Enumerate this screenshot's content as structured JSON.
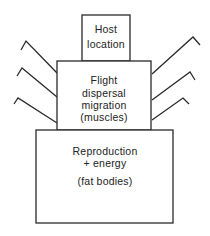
{
  "diagram": {
    "boxes": [
      {
        "id": "host",
        "lines": [
          "Host",
          "location"
        ]
      },
      {
        "id": "flight",
        "lines": [
          "Flight",
          "dispersal",
          "migration",
          "(muscles)"
        ]
      },
      {
        "id": "reproduction",
        "lines": [
          "Reproduction",
          "+ energy",
          "(fat bodies)"
        ]
      }
    ],
    "legs": {
      "left": 3,
      "right": 3
    },
    "colors": {
      "stroke": "#2a2a2a",
      "text": "#222222",
      "background": "#ffffff"
    }
  }
}
